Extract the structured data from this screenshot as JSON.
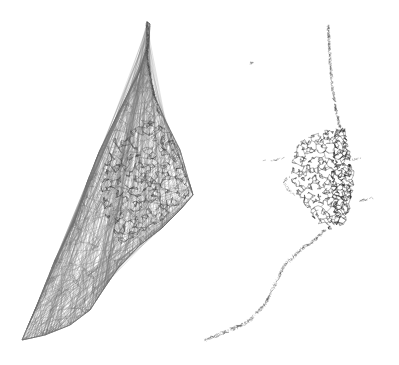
{
  "figure": {
    "panels": [
      {
        "name": "triangulated-mesh",
        "outline": [
          [
            147,
            22
          ],
          [
            150,
            24
          ],
          [
            149,
            40
          ],
          [
            147,
            56
          ],
          [
            150,
            75
          ],
          [
            154,
            95
          ],
          [
            165,
            120
          ],
          [
            180,
            150
          ],
          [
            190,
            185
          ],
          [
            193,
            195
          ],
          [
            180,
            210
          ],
          [
            162,
            228
          ],
          [
            140,
            245
          ],
          [
            118,
            268
          ],
          [
            103,
            290
          ],
          [
            90,
            310
          ],
          [
            70,
            325
          ],
          [
            45,
            335
          ],
          [
            22,
            340
          ],
          [
            35,
            310
          ],
          [
            55,
            260
          ],
          [
            75,
            220
          ],
          [
            88,
            180
          ],
          [
            100,
            150
          ],
          [
            120,
            110
          ],
          [
            140,
            70
          ],
          [
            146,
            50
          ]
        ],
        "dense_region": [
          [
            110,
            140
          ],
          [
            150,
            120
          ],
          [
            170,
            130
          ],
          [
            185,
            165
          ],
          [
            190,
            195
          ],
          [
            170,
            215
          ],
          [
            145,
            232
          ],
          [
            120,
            245
          ],
          [
            105,
            215
          ],
          [
            100,
            180
          ]
        ],
        "stroke": "#555555"
      },
      {
        "name": "pruned-network",
        "spine": [
          [
            328,
            24
          ],
          [
            329,
            40
          ],
          [
            330,
            60
          ],
          [
            332,
            85
          ],
          [
            336,
            110
          ],
          [
            340,
            127
          ]
        ],
        "dense_region": [
          [
            300,
            140
          ],
          [
            325,
            130
          ],
          [
            345,
            127
          ],
          [
            350,
            150
          ],
          [
            355,
            175
          ],
          [
            352,
            200
          ],
          [
            345,
            225
          ],
          [
            330,
            230
          ],
          [
            315,
            222
          ],
          [
            305,
            205
          ],
          [
            293,
            190
          ],
          [
            290,
            170
          ],
          [
            295,
            150
          ]
        ],
        "tail": [
          [
            325,
            230
          ],
          [
            315,
            240
          ],
          [
            300,
            250
          ],
          [
            285,
            265
          ],
          [
            275,
            285
          ],
          [
            265,
            305
          ],
          [
            248,
            322
          ],
          [
            230,
            330
          ],
          [
            205,
            340
          ]
        ],
        "fragments": [
          [
            [
              262,
              162
            ],
            [
              285,
              158
            ]
          ],
          [
            [
              352,
              160
            ],
            [
              360,
              158
            ]
          ],
          [
            [
              355,
              202
            ],
            [
              373,
              198
            ]
          ],
          [
            [
              250,
              63
            ],
            [
              253,
              63
            ]
          ]
        ],
        "stroke": "#444444"
      }
    ]
  }
}
